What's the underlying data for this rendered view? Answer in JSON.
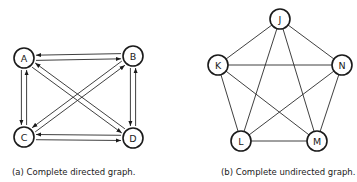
{
  "figure_a": {
    "caption": "(a) Complete directed graph.",
    "nodes": [
      {
        "id": "A",
        "x": 24,
        "y": 58
      },
      {
        "id": "B",
        "x": 133,
        "y": 56
      },
      {
        "id": "C",
        "x": 24,
        "y": 137
      },
      {
        "id": "D",
        "x": 133,
        "y": 138
      }
    ],
    "edges": [
      [
        "A",
        "B"
      ],
      [
        "B",
        "A"
      ],
      [
        "A",
        "C"
      ],
      [
        "C",
        "A"
      ],
      [
        "A",
        "D"
      ],
      [
        "D",
        "A"
      ],
      [
        "B",
        "C"
      ],
      [
        "C",
        "B"
      ],
      [
        "B",
        "D"
      ],
      [
        "D",
        "B"
      ],
      [
        "C",
        "D"
      ],
      [
        "D",
        "C"
      ]
    ]
  },
  "figure_b": {
    "caption": "(b) Complete undirected graph.",
    "nodes": [
      {
        "id": "J",
        "x": 280,
        "y": 19
      },
      {
        "id": "K",
        "x": 218,
        "y": 65
      },
      {
        "id": "N",
        "x": 342,
        "y": 65
      },
      {
        "id": "L",
        "x": 241,
        "y": 141
      },
      {
        "id": "M",
        "x": 317,
        "y": 141
      }
    ],
    "edges": [
      [
        "J",
        "K"
      ],
      [
        "J",
        "N"
      ],
      [
        "J",
        "L"
      ],
      [
        "J",
        "M"
      ],
      [
        "K",
        "N"
      ],
      [
        "K",
        "L"
      ],
      [
        "K",
        "M"
      ],
      [
        "N",
        "L"
      ],
      [
        "N",
        "M"
      ],
      [
        "L",
        "M"
      ]
    ]
  },
  "style": {
    "stroke": "#1a1a1a",
    "background": "#ffffff"
  }
}
